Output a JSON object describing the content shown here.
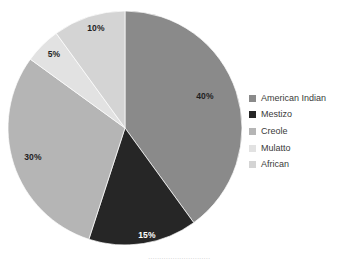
{
  "chart_data": {
    "type": "pie",
    "title": "",
    "categories": [
      "American Indian",
      "Mestizo",
      "Creole",
      "Mulatto",
      "African"
    ],
    "values": [
      40,
      15,
      30,
      5,
      10
    ],
    "value_labels": [
      "40%",
      "15%",
      "30%",
      "5%",
      "10%"
    ],
    "unit": "%",
    "total": 100,
    "start_angle_deg": 0,
    "direction": "clockwise",
    "legend_position": "right",
    "grid": false,
    "colors": [
      "#8a8a8a",
      "#262626",
      "#b5b5b5",
      "#e2e2e2",
      "#d4d4d4"
    ],
    "label_colors": [
      "#1f1f1f",
      "#ffffff",
      "#1f1f1f",
      "#1f1f1f",
      "#1f1f1f"
    ],
    "slices": [
      {
        "name": "American Indian",
        "value": 40,
        "label": "40%",
        "color": "#8a8a8a",
        "label_color": "#1f1f1f",
        "start_deg": 0,
        "end_deg": 144,
        "label_x": 205,
        "label_y": 99
      },
      {
        "name": "Mestizo",
        "value": 15,
        "label": "15%",
        "color": "#262626",
        "label_color": "#ffffff",
        "start_deg": 144,
        "end_deg": 198,
        "label_x": 147,
        "label_y": 238
      },
      {
        "name": "Creole",
        "value": 30,
        "label": "30%",
        "color": "#b5b5b5",
        "label_color": "#1f1f1f",
        "start_deg": 198,
        "end_deg": 306,
        "label_x": 33,
        "label_y": 160
      },
      {
        "name": "Mulatto",
        "value": 5,
        "label": "5%",
        "color": "#e2e2e2",
        "label_color": "#1f1f1f",
        "start_deg": 306,
        "end_deg": 324,
        "label_x": 54,
        "label_y": 57
      },
      {
        "name": "African",
        "value": 10,
        "label": "10%",
        "color": "#d4d4d4",
        "label_color": "#1f1f1f",
        "start_deg": 324,
        "end_deg": 360,
        "label_x": 96,
        "label_y": 31
      }
    ],
    "geometry": {
      "center_x": 125,
      "center_y": 128,
      "radius": 117
    }
  },
  "legend": {
    "items": [
      {
        "label": "American Indian",
        "color": "#8a8a8a"
      },
      {
        "label": "Mestizo",
        "color": "#262626"
      },
      {
        "label": "Creole",
        "color": "#b5b5b5"
      },
      {
        "label": "Mulatto",
        "color": "#e2e2e2"
      },
      {
        "label": "African",
        "color": "#d4d4d4"
      }
    ]
  },
  "footer": {
    "clipped_text": "............................"
  }
}
